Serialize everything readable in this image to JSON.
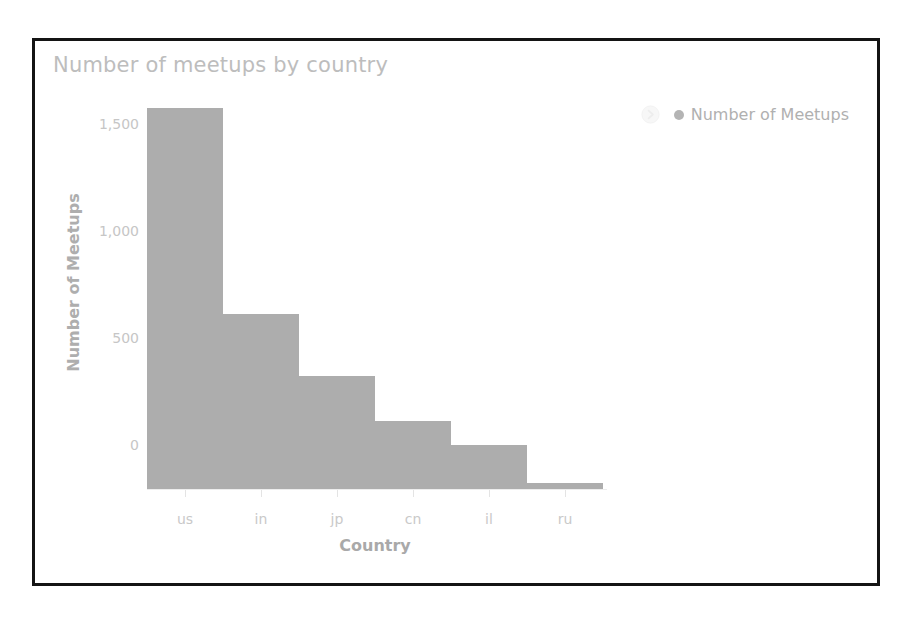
{
  "panel": {
    "border_color": "#141414",
    "background": "#ffffff"
  },
  "chart_header": {
    "title": "Number of meetups by country"
  },
  "legend": {
    "toggle_icon": "chevron-circle-icon",
    "entries": [
      {
        "label": "Number of Meetups",
        "color": "#b4b4b4",
        "marker": "dot"
      }
    ],
    "position": "top-right"
  },
  "chart_data": {
    "type": "bar",
    "title": "Number of meetups by country",
    "xlabel": "Country",
    "ylabel": "Number of Meetups",
    "categories": [
      "us",
      "in",
      "jp",
      "cn",
      "il",
      "ru"
    ],
    "values": [
      1775,
      815,
      525,
      315,
      205,
      30
    ],
    "series": [
      {
        "name": "Number of Meetups",
        "values": [
          1775,
          815,
          525,
          315,
          205,
          30
        ],
        "color": "#adadad"
      }
    ],
    "ylim": [
      0,
      1800
    ],
    "ytick_values": [
      0,
      500,
      1000,
      1500
    ],
    "ytick_labels": [
      "0",
      "500",
      "1,000",
      "1,500"
    ],
    "grid": false,
    "legend_position": "top-right",
    "bar_color": "#adadad",
    "axis_label_color": "#c6c6c6"
  }
}
